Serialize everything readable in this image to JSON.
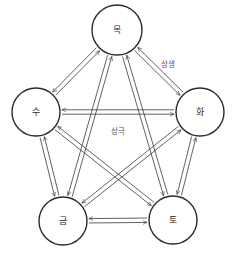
{
  "diagram": {
    "colors": {
      "stroke": "#2a2a2a",
      "background": "#ffffff",
      "label": "#555555"
    },
    "nodes": [
      {
        "id": "mok",
        "label": "목",
        "x": 117,
        "y": 30,
        "r": 25
      },
      {
        "id": "hwa",
        "label": "화",
        "x": 200,
        "y": 112,
        "r": 24
      },
      {
        "id": "to",
        "label": "토",
        "x": 173,
        "y": 220,
        "r": 24
      },
      {
        "id": "geum",
        "label": "금",
        "x": 63,
        "y": 221,
        "r": 24
      },
      {
        "id": "su",
        "label": "수",
        "x": 36,
        "y": 112,
        "r": 24
      }
    ],
    "edges": [
      {
        "from": "mok",
        "to": "hwa",
        "type": "상생",
        "bidirectional": true
      },
      {
        "from": "hwa",
        "to": "to",
        "type": "상생",
        "bidirectional": true
      },
      {
        "from": "to",
        "to": "geum",
        "type": "상생",
        "bidirectional": true
      },
      {
        "from": "geum",
        "to": "su",
        "type": "상생",
        "bidirectional": true
      },
      {
        "from": "su",
        "to": "mok",
        "type": "상생",
        "bidirectional": true
      },
      {
        "from": "mok",
        "to": "to",
        "type": "상극",
        "bidirectional": true
      },
      {
        "from": "mok",
        "to": "geum",
        "type": "상극",
        "bidirectional": true
      },
      {
        "from": "hwa",
        "to": "su",
        "type": "상극",
        "bidirectional": true
      },
      {
        "from": "hwa",
        "to": "geum",
        "type": "상극",
        "bidirectional": true
      },
      {
        "from": "su",
        "to": "to",
        "type": "상극",
        "bidirectional": true
      }
    ],
    "labels": {
      "generating": {
        "text": "상생",
        "x": 168,
        "y": 64
      },
      "overcoming": {
        "text": "상극",
        "x": 118,
        "y": 131
      }
    }
  }
}
